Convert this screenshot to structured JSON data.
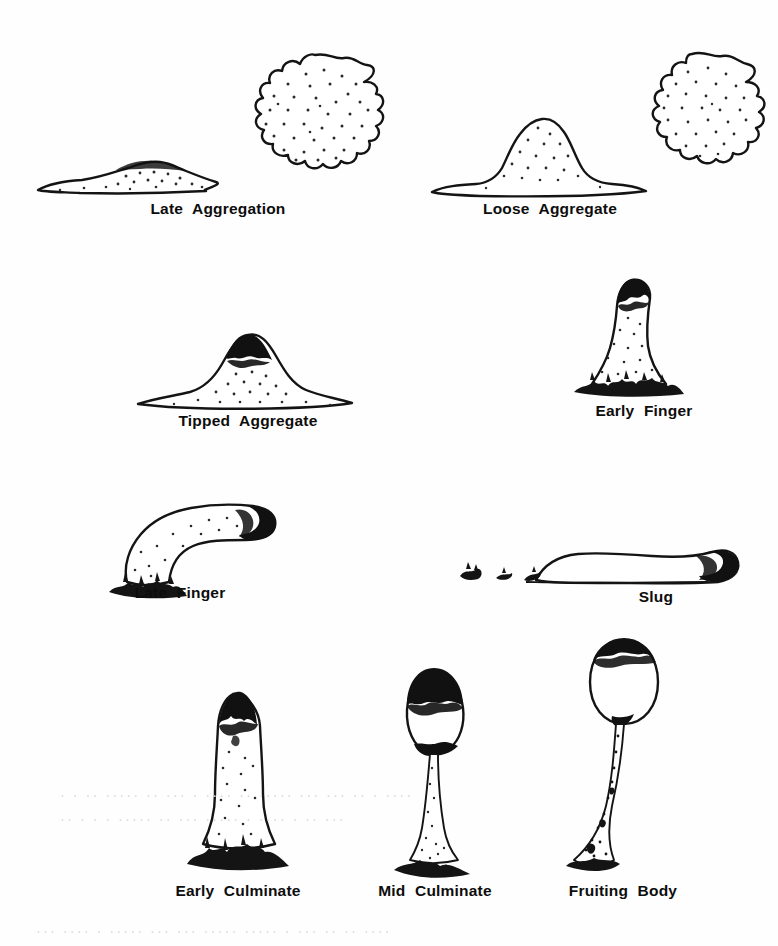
{
  "figure": {
    "type": "scientific-line-drawing",
    "background_color": "#fefefe",
    "ink_color": "#111111",
    "page_width": 778,
    "page_height": 946
  },
  "stages": [
    {
      "id": "late-aggregation",
      "label": "Late Aggregation",
      "views": [
        "side",
        "top"
      ],
      "label_left": 118,
      "label_top": 200,
      "art_left": 20,
      "art_top": 40,
      "art_width": 380,
      "art_height": 160,
      "description": "Low flat bumpy mound, side view; stippled crenulated round top view"
    },
    {
      "id": "loose-aggregate",
      "label": "Loose Aggregate",
      "views": [
        "side",
        "top"
      ],
      "label_left": 508,
      "label_top": 200,
      "art_left": 420,
      "art_top": 40,
      "art_width": 350,
      "art_height": 160,
      "description": "Taller rounded mound, side view; stippled crenulated round top view"
    },
    {
      "id": "tipped-aggregate",
      "label": "Tipped Aggregate",
      "views": [
        "side"
      ],
      "label_left": 178,
      "label_top": 412,
      "art_left": 130,
      "art_top": 320,
      "art_width": 260,
      "art_height": 95,
      "description": "Broad mound with dark pigmented apical tip"
    },
    {
      "id": "early-finger",
      "label": "Early Finger",
      "views": [
        "side"
      ],
      "label_left": 566,
      "label_top": 412,
      "art_left": 570,
      "art_top": 262,
      "art_width": 130,
      "art_height": 150,
      "description": "Upright stubby column with dark rounded tip and dark base"
    },
    {
      "id": "late-finger",
      "label": "Late Finger",
      "views": [
        "side"
      ],
      "label_left": 100,
      "label_top": 588,
      "art_left": 105,
      "art_top": 490,
      "art_width": 235,
      "art_height": 95,
      "description": "S-curved elongated finger falling over, dark anterior tip upper right, dark base lower left"
    },
    {
      "id": "slug",
      "label": "Slug",
      "views": [
        "side"
      ],
      "label_left": 656,
      "label_top": 588,
      "art_left": 440,
      "art_top": 540,
      "art_width": 300,
      "art_height": 50,
      "description": "Horizontal migrating slug with dark anterior tip at right and slime trail marks behind at left"
    },
    {
      "id": "early-culminate",
      "label": "Early Culminate",
      "views": [
        "side"
      ],
      "label_left": 128,
      "label_top": 882,
      "art_left": 185,
      "art_top": 690,
      "art_width": 90,
      "art_height": 180,
      "description": "Tall vertical column, dark pointed apex, flared bristly dark base"
    },
    {
      "id": "mid-culminate",
      "label": "Mid Culminate",
      "views": [
        "side"
      ],
      "label_left": 330,
      "label_top": 882,
      "art_left": 380,
      "art_top": 660,
      "art_width": 90,
      "art_height": 210,
      "description": "Thin stalk with flared base lifting an oval sorus capped by dark mass"
    },
    {
      "id": "fruiting-body",
      "label": "Fruiting Body",
      "views": [
        "side"
      ],
      "label_left": 518,
      "label_top": 882,
      "art_left": 560,
      "art_top": 630,
      "art_width": 110,
      "art_height": 240,
      "description": "Long curved tapering stalk bearing a round spore head with dark cap"
    }
  ],
  "ghost_text": [
    {
      "text": "· · ·· ····· ·· ··· · ···· ·· ····· ··· ··· ·· · ····",
      "left": 60,
      "top": 788
    },
    {
      "text": "·· · · · ····· ·· ··· ····· · ···· · ·· ···",
      "left": 60,
      "top": 812
    },
    {
      "text": "··· ···· · ····· ··· ··· ····· ····· · ··· ·· ·· ····",
      "left": 36,
      "top": 924
    }
  ]
}
